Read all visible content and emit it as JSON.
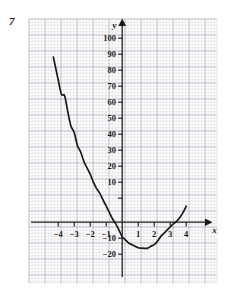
{
  "question_number": "7",
  "chart_data": {
    "type": "line",
    "title": "",
    "subtitle": "",
    "xlabel": "x",
    "ylabel": "y",
    "xlim": [
      -5.1,
      4.85
    ],
    "ylim": [
      -26,
      108
    ],
    "grid": true,
    "grid_minor_step_x": 0.2,
    "grid_minor_step_y": 2,
    "grid_major_step_x": 1,
    "grid_major_step_y": 10,
    "legend": "none",
    "x_ticks": [
      -4,
      -3,
      -2,
      -1,
      1,
      2,
      3,
      4
    ],
    "x_tick_labels": [
      "−4",
      "−3",
      "−2",
      "−1",
      "1",
      "2",
      "3",
      "4"
    ],
    "y_ticks": [
      -20,
      -10,
      10,
      20,
      30,
      40,
      50,
      60,
      70,
      80,
      90,
      100
    ],
    "y_tick_labels": [
      "−20",
      "−10",
      "10",
      "20",
      "30",
      "40",
      "50",
      "60",
      "70",
      "80",
      "90",
      "100"
    ],
    "curve_color": "#1a1a1a",
    "grid_color": "#c9c9cf",
    "grid_major_color": "#a8a8b2",
    "axis_color": "#1a1a1a",
    "series": [
      {
        "name": "quadratic",
        "x": [
          -4.3,
          -4.2,
          -4.0,
          -3.8,
          -3.6,
          -3.4,
          -3.2,
          -3.0,
          -2.8,
          -2.6,
          -2.4,
          -2.2,
          -2.0,
          -1.8,
          -1.6,
          -1.4,
          -1.2,
          -1.0,
          -0.8,
          -0.6,
          -0.4,
          -0.2,
          0.0,
          0.2,
          0.4,
          0.6,
          0.8,
          1.0,
          1.2,
          1.4,
          1.5,
          1.6,
          1.8,
          2.0,
          2.2,
          2.4,
          2.6,
          2.8,
          3.0,
          3.2,
          3.4,
          3.6,
          3.8,
          4.0
        ],
        "y": [
          103.2,
          98.4,
          89.0,
          80.0,
          79.0,
          69.0,
          60.0,
          56.0,
          48.0,
          44.0,
          38.0,
          34.0,
          30.0,
          25.0,
          21.0,
          18.0,
          14.0,
          10.0,
          6.0,
          2.0,
          -1.0,
          -5.0,
          -9.0,
          -11.0,
          -13.0,
          -14.0,
          -15.0,
          -16.0,
          -16.2,
          -16.3,
          -16.3,
          -16.2,
          -15.0,
          -14.0,
          -12.0,
          -9.0,
          -7.0,
          -5.0,
          -3.0,
          -1.0,
          0.5,
          3.0,
          6.0,
          10.0
        ]
      }
    ],
    "annotations": []
  }
}
